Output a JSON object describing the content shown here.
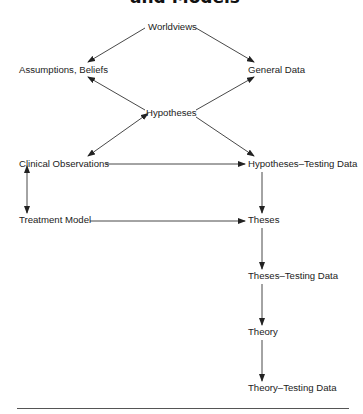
{
  "title": "and Models",
  "nodes": {
    "worldviews": "Worldviews",
    "assumptions_beliefs": "Assumptions, Beliefs",
    "general_data": "General Data",
    "hypotheses": "Hypotheses",
    "clinical_observations": "Clinical Observations",
    "hypotheses_testing_data": "Hypotheses–Testing Data",
    "treatment_model": "Treatment Model",
    "theses": "Theses",
    "theses_testing_data": "Theses–Testing Data",
    "theory": "Theory",
    "theory_testing_data": "Theory–Testing Data"
  },
  "edges": [
    {
      "from": "Worldviews",
      "to": "Assumptions, Beliefs",
      "type": "directed"
    },
    {
      "from": "Worldviews",
      "to": "General Data",
      "type": "directed"
    },
    {
      "from": "Hypotheses",
      "to": "Assumptions, Beliefs",
      "type": "directed"
    },
    {
      "from": "Hypotheses",
      "to": "General Data",
      "type": "directed"
    },
    {
      "from": "Hypotheses",
      "to": "Clinical Observations",
      "type": "bidirectional"
    },
    {
      "from": "Hypotheses",
      "to": "Hypotheses–Testing Data",
      "type": "directed"
    },
    {
      "from": "Clinical Observations",
      "to": "Hypotheses–Testing Data",
      "type": "directed"
    },
    {
      "from": "Clinical Observations",
      "to": "Treatment Model",
      "type": "bidirectional"
    },
    {
      "from": "Treatment Model",
      "to": "Theses",
      "type": "directed"
    },
    {
      "from": "Hypotheses–Testing Data",
      "to": "Theses",
      "type": "directed"
    },
    {
      "from": "Theses",
      "to": "Theses–Testing Data",
      "type": "directed"
    },
    {
      "from": "Theses–Testing Data",
      "to": "Theory",
      "type": "directed"
    },
    {
      "from": "Theory",
      "to": "Theory–Testing Data",
      "type": "directed"
    }
  ]
}
